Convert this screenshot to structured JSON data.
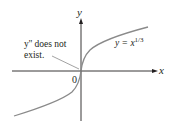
{
  "figure": {
    "axes": {
      "x_label": "x",
      "y_label": "y",
      "origin_label": "0"
    },
    "curve": {
      "equation_prefix": "y = x",
      "exponent": "1/3",
      "color": "#8a8a8a"
    },
    "annotation": {
      "line1": "y'' does not",
      "line2": "exist."
    },
    "colors": {
      "axis": "#231f20",
      "text": "#231f20",
      "curve": "#8a8a8a",
      "background": "#ffffff"
    }
  }
}
